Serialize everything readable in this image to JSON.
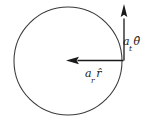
{
  "figure": {
    "background_color": "#ffffff",
    "stroke_color": "#3a3a3a",
    "arrow_color": "#1a1a1a",
    "text_color": "#1a1a1a",
    "width": 152,
    "height": 127
  },
  "circle": {
    "name": "trajectory-circle",
    "center_x": 68,
    "center_y": 61,
    "radius": 54,
    "stroke_width": 1
  },
  "vectors": [
    {
      "id": "tangential",
      "name": "tangential-acceleration-vector",
      "direction": "up",
      "tail_x": 124,
      "tail_y": 60,
      "tip_x": 124,
      "tip_y": 4,
      "label_base": "a",
      "label_subscript": "t",
      "label_unitvector": "θ̂",
      "label_full": "aₜθ̂"
    },
    {
      "id": "radial",
      "name": "radial-acceleration-vector",
      "direction": "left",
      "tail_x": 124,
      "tail_y": 60,
      "tip_x": 66,
      "tip_y": 60,
      "label_base": "a",
      "label_subscript": "r",
      "label_unitvector": "r̂",
      "label_full": "aᵣr̂"
    }
  ]
}
